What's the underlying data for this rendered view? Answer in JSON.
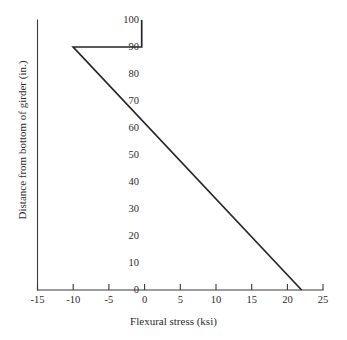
{
  "chart_data": {
    "type": "line",
    "title": "",
    "xlabel": "Flexural stress (ksi)",
    "ylabel": "Distance from bottom of girder (in.)",
    "xlim": [
      -15,
      25
    ],
    "ylim": [
      0,
      100
    ],
    "xticks": [
      -15,
      -10,
      -5,
      0,
      5,
      10,
      15,
      20,
      25
    ],
    "xticklabels": [
      "-15",
      "-10",
      "-5",
      "0",
      "5",
      "10",
      "15",
      "20",
      "25"
    ],
    "yticks": [
      0,
      10,
      20,
      30,
      40,
      50,
      60,
      70,
      80,
      90,
      100
    ],
    "yticklabels": [
      "0",
      "10",
      "20",
      "30",
      "40",
      "50",
      "60",
      "70",
      "80",
      "90",
      "100"
    ],
    "grid": false,
    "legend": null,
    "series": [
      {
        "name": "Flexural stress distribution",
        "points": [
          {
            "x": -0.4,
            "y": 100
          },
          {
            "x": -0.4,
            "y": 90
          },
          {
            "x": -10.0,
            "y": 90
          },
          {
            "x": 22.0,
            "y": 0
          }
        ]
      }
    ],
    "annotations": [],
    "colors": {
      "line": "#262626",
      "axis": "#3a3a3a",
      "text": "#2b2b2b",
      "background": "#ffffff"
    }
  }
}
